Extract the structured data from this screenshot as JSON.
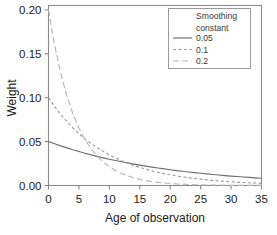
{
  "chart_data": {
    "type": "line",
    "title": "",
    "xlabel": "Age of observation",
    "ylabel": "Weight",
    "xlim": [
      0,
      35
    ],
    "ylim": [
      0,
      0.205
    ],
    "xticks": [
      0,
      5,
      10,
      15,
      20,
      25,
      30,
      35
    ],
    "xtick_labels": [
      "0",
      "5",
      "10",
      "15",
      "20",
      "25",
      "30",
      "35"
    ],
    "yticks": [
      0.0,
      0.05,
      0.1,
      0.15,
      0.2
    ],
    "ytick_labels": [
      "0.00",
      "0.05",
      "0.10",
      "0.15",
      "0.20"
    ],
    "grid": false,
    "legend_position": "top-right",
    "legend_title": "Smoothing constant",
    "x": [
      0,
      1,
      2,
      3,
      4,
      5,
      6,
      7,
      8,
      9,
      10,
      11,
      12,
      13,
      14,
      15,
      16,
      17,
      18,
      19,
      20,
      21,
      22,
      23,
      24,
      25,
      26,
      27,
      28,
      29,
      30,
      31,
      32,
      33,
      34,
      35
    ],
    "series": [
      {
        "name": "0.05",
        "linestyle": "solid",
        "color": "#6e6e6e",
        "values": [
          0.05,
          0.0475,
          0.0451,
          0.0429,
          0.0407,
          0.0387,
          0.0368,
          0.0349,
          0.0332,
          0.0315,
          0.0299,
          0.0284,
          0.027,
          0.0257,
          0.0244,
          0.0232,
          0.022,
          0.0209,
          0.0199,
          0.0189,
          0.0179,
          0.017,
          0.0162,
          0.0154,
          0.0146,
          0.0139,
          0.0132,
          0.0125,
          0.0119,
          0.0113,
          0.0107,
          0.0102,
          0.0097,
          0.0092,
          0.0087,
          0.0083
        ]
      },
      {
        "name": "0.1",
        "linestyle": "dotted",
        "color": "#9a9a9a",
        "values": [
          0.1,
          0.09,
          0.081,
          0.0729,
          0.0656,
          0.059,
          0.0531,
          0.0478,
          0.043,
          0.0387,
          0.0349,
          0.0314,
          0.0282,
          0.0254,
          0.0229,
          0.0206,
          0.0185,
          0.0167,
          0.015,
          0.0135,
          0.0122,
          0.0109,
          0.0098,
          0.0089,
          0.008,
          0.0072,
          0.0065,
          0.0058,
          0.0052,
          0.0047,
          0.0042,
          0.0038,
          0.0034,
          0.0031,
          0.0028,
          0.0025
        ]
      },
      {
        "name": "0.2",
        "linestyle": "dashed",
        "color": "#b5b5b5",
        "values": [
          0.2,
          0.16,
          0.128,
          0.1024,
          0.0819,
          0.0655,
          0.0524,
          0.0419,
          0.0336,
          0.0268,
          0.0215,
          0.0172,
          0.0137,
          0.011,
          0.0088,
          0.007,
          0.0056,
          0.0045,
          0.0036,
          0.0029,
          0.0023,
          0.0018,
          0.0015,
          0.0012,
          0.0009,
          0.0008,
          0.0006,
          0.0005,
          0.0004,
          0.0003,
          0.0002,
          0.0002,
          0.0002,
          0.0001,
          0.0001,
          0.0001
        ]
      }
    ]
  },
  "legend": {
    "title_line1": "Smoothing",
    "title_line2": "constant",
    "entries": [
      {
        "label": "0.05"
      },
      {
        "label": "0.1"
      },
      {
        "label": "0.2"
      }
    ]
  },
  "axes": {
    "x_title": "Age of observation",
    "y_title": "Weight"
  },
  "colors": {
    "frame": "#8a8a8a",
    "background": "#ffffff",
    "text": "#1a1a1a"
  }
}
